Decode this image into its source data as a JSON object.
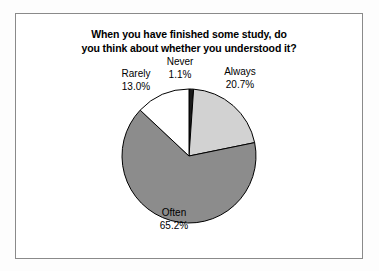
{
  "figure": {
    "background_color": "#ffffff",
    "frame_color": "#8a8a8a"
  },
  "chart_data": {
    "type": "pie",
    "title": "When you have finished some study, do you think about whether you understood it?",
    "title_lines": [
      "When you have finished some study, do",
      "you think about whether you understood it?"
    ],
    "categories": [
      "Never",
      "Always",
      "Often",
      "Rarely"
    ],
    "values": [
      1.1,
      20.7,
      65.2,
      13.0
    ],
    "value_unit": "%",
    "start_angle_deg": 0,
    "direction": "clockwise",
    "legend": "none",
    "grid": false,
    "xlabel": "",
    "ylabel": "",
    "slices": [
      {
        "label": "Never",
        "value": 1.1,
        "value_text": "1.1%",
        "color": "#1a1a1a",
        "edge_color": "#000000",
        "start_deg": 0,
        "end_deg": 3.96
      },
      {
        "label": "Always",
        "value": 20.7,
        "value_text": "20.7%",
        "color": "#d2d2d2",
        "edge_color": "#000000",
        "start_deg": 3.96,
        "end_deg": 78.48
      },
      {
        "label": "Often",
        "value": 65.2,
        "value_text": "65.2%",
        "color": "#8c8c8c",
        "edge_color": "#000000",
        "start_deg": 78.48,
        "end_deg": 313.2
      },
      {
        "label": "Rarely",
        "value": 13.0,
        "value_text": "13.0%",
        "color": "#ffffff",
        "edge_color": "#000000",
        "start_deg": 313.2,
        "end_deg": 360
      }
    ]
  },
  "labels": {
    "rarely": {
      "name": "Rarely",
      "pct": "13.0%"
    },
    "never": {
      "name": "Never",
      "pct": "1.1%"
    },
    "always": {
      "name": "Always",
      "pct": "20.7%"
    },
    "often": {
      "name": "Often",
      "pct": "65.2%"
    }
  }
}
